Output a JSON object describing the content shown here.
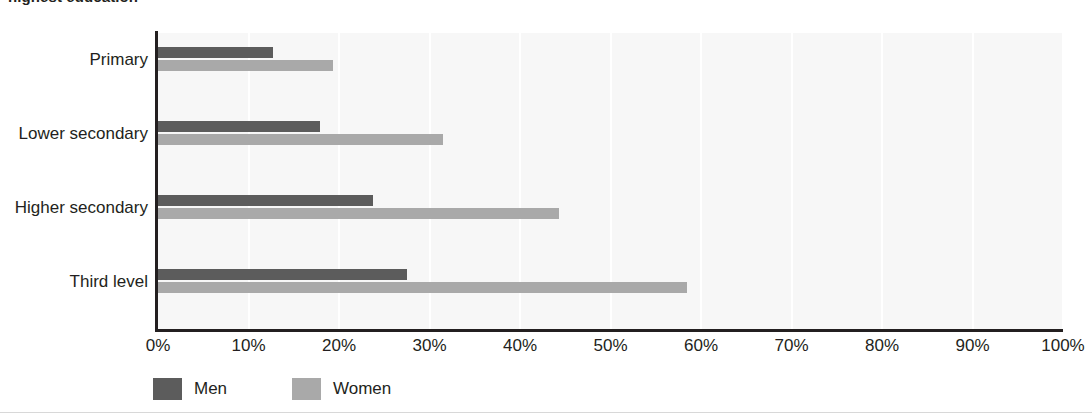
{
  "chart_data": {
    "type": "bar",
    "orientation": "horizontal",
    "title": "highest education",
    "categories": [
      "Primary",
      "Lower secondary",
      "Higher secondary",
      "Third level"
    ],
    "series": [
      {
        "name": "Men",
        "color": "#5c5c5c",
        "values": [
          12.7,
          17.9,
          23.8,
          27.5
        ]
      },
      {
        "name": "Women",
        "color": "#a9a9a9",
        "values": [
          19.3,
          31.5,
          44.3,
          58.5
        ]
      }
    ],
    "xlabel": "",
    "ylabel": "",
    "xlim": [
      0,
      100
    ],
    "xticks": [
      "0%",
      "10%",
      "20%",
      "30%",
      "40%",
      "50%",
      "60%",
      "70%",
      "80%",
      "90%",
      "100%"
    ],
    "xtick_values": [
      0,
      10,
      20,
      30,
      40,
      50,
      60,
      70,
      80,
      90,
      100
    ],
    "grid": "vertical",
    "legend_position": "bottom-left",
    "plot_background": "#f7f7f7"
  }
}
